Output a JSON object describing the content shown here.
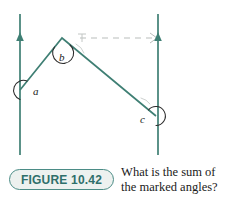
{
  "figure": {
    "badge_label": "FIGURE 10.42",
    "caption_line_1": "What is the sum of",
    "caption_line_2": "the marked angles?",
    "badge_border_color": "#4b8c86",
    "badge_fill_color": "#edf1ef",
    "badge_text_color": "#2f6f6a"
  },
  "diagram": {
    "line_color": "#3f7f74",
    "dashed_line_color": "#b9bdbb",
    "label_color": "#1a1a1a",
    "labels": {
      "a": "a",
      "b": "b",
      "c": "c"
    },
    "geometry": {
      "left_line_x": 20,
      "right_line_x": 158,
      "line_top_y": 14,
      "line_bottom_y": 155,
      "vertex_a": [
        20,
        90
      ],
      "vertex_b": [
        62,
        38
      ],
      "vertex_c": [
        156,
        116
      ],
      "dashed_y": 38,
      "dashed_x_start": 80,
      "dashed_x_end": 158,
      "arrow_left_y": 38,
      "arrow_right_y": 38
    }
  }
}
